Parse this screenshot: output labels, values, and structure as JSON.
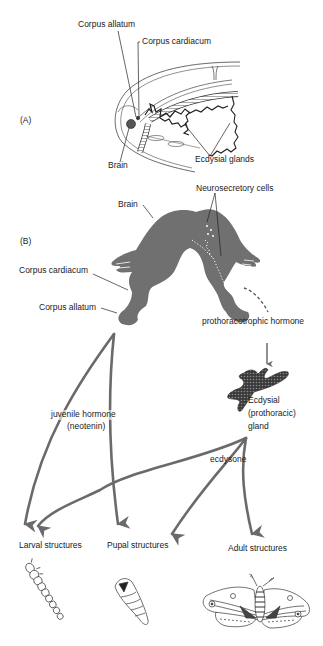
{
  "panel_a": {
    "label": "(A)",
    "callouts": {
      "corpus_allatum": "Corpus allatum",
      "corpus_cardiacum": "Corpus cardiacum",
      "brain": "Brain",
      "ecdysial_glands": "Ecdysial glands"
    }
  },
  "panel_b": {
    "label": "(B)",
    "callouts": {
      "brain": "Brain",
      "neurosecretory_cells": "Neurosecretory cells",
      "corpus_cardiacum": "Corpus cardiacum",
      "corpus_allatum": "Corpus allatum",
      "prothoracotrophic_hormone": "prothoracotrophic hormone",
      "ecdysial_gland_line1": "Ecdysial",
      "ecdysial_gland_line2": "(prothoracic)",
      "ecdysial_gland_line3": "gland",
      "juvenile_hormone_line1": "juvenile hormone",
      "juvenile_hormone_line2": "(neotenin)",
      "ecdysone": "ecdysone"
    },
    "outcomes": {
      "larval": "Larval structures",
      "pupal": "Pupal structures",
      "adult": "Adult structures"
    }
  },
  "colors": {
    "tissue_gray": "#707070",
    "arrow_gray": "#6a6a6a",
    "line": "#222222"
  }
}
